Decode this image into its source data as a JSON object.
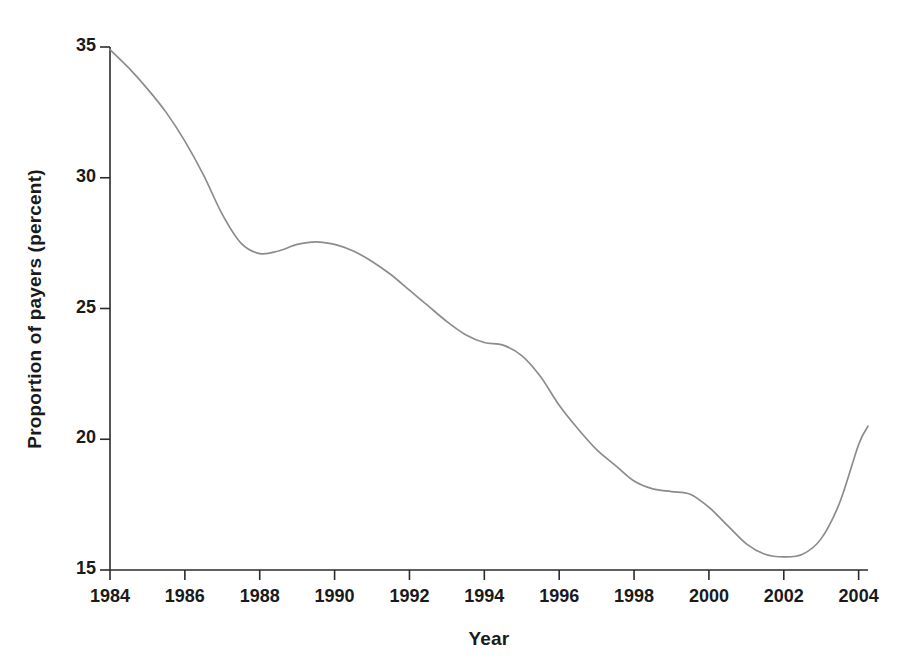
{
  "chart_data": {
    "type": "line",
    "title": "",
    "xlabel": "Year",
    "ylabel": "Proportion of payers (percent)",
    "xlim": [
      1984,
      2004.25
    ],
    "ylim": [
      15,
      35
    ],
    "grid": false,
    "legend": "none",
    "line_color": "#8c8c8c",
    "axis_color": "#2b2b2b",
    "x_ticks": [
      1984,
      1986,
      1988,
      1990,
      1992,
      1994,
      1996,
      1998,
      2000,
      2002,
      2004
    ],
    "x_tick_labels": [
      "1984",
      "1986",
      "1988",
      "1990",
      "1992",
      "1994",
      "1996",
      "1998",
      "2000",
      "2002",
      "2004"
    ],
    "y_ticks": [
      15,
      20,
      25,
      30,
      35
    ],
    "y_tick_labels": [
      "15",
      "20",
      "25",
      "30",
      "35"
    ],
    "series": [
      {
        "name": "Proportion of payers",
        "x": [
          1984,
          1984.5,
          1985,
          1985.5,
          1986,
          1986.5,
          1987,
          1987.5,
          1988,
          1988.5,
          1989,
          1989.5,
          1990,
          1990.5,
          1991,
          1991.5,
          1992,
          1992.5,
          1993,
          1993.5,
          1994,
          1994.5,
          1995,
          1995.5,
          1996,
          1996.5,
          1997,
          1997.5,
          1998,
          1998.5,
          1999,
          1999.5,
          2000,
          2000.5,
          2001,
          2001.5,
          2002,
          2002.5,
          2003,
          2003.5,
          2004,
          2004.25
        ],
        "y": [
          34.9,
          34.2,
          33.4,
          32.5,
          31.4,
          30.1,
          28.6,
          27.5,
          27.1,
          27.2,
          27.45,
          27.55,
          27.45,
          27.2,
          26.8,
          26.3,
          25.7,
          25.1,
          24.5,
          24.0,
          23.7,
          23.6,
          23.2,
          22.4,
          21.3,
          20.4,
          19.6,
          19.0,
          18.4,
          18.1,
          18.0,
          17.9,
          17.4,
          16.7,
          16.0,
          15.6,
          15.5,
          15.6,
          16.2,
          17.6,
          19.8,
          20.5
        ]
      }
    ],
    "annotations": []
  },
  "axes": {
    "y_title": "Proportion of payers (percent)",
    "x_title": "Year"
  }
}
